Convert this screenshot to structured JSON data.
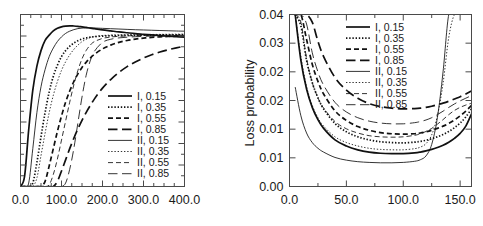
{
  "figure": {
    "panels": [
      {
        "id": "left",
        "xlabel": "",
        "ylabel": "",
        "xticks": [
          "0.0",
          "100.0",
          "200.0",
          "300.0",
          "400.0"
        ],
        "yticks": [],
        "xlim": [
          0,
          400
        ],
        "ylim": [
          0,
          1
        ]
      },
      {
        "id": "right",
        "xlabel": "",
        "ylabel": "Loss probability",
        "xticks": [
          "0.0",
          "50.0",
          "100.0",
          "150.0"
        ],
        "yticks": [
          "0.00",
          "0.01",
          "0.01",
          "0.02",
          "0.02",
          "0.03",
          "0.04"
        ],
        "xlim": [
          0,
          160
        ],
        "ylim": [
          0,
          0.045
        ]
      }
    ],
    "legend": {
      "entries": [
        {
          "label": "I, 0.15",
          "style": "solid",
          "weight": "thick"
        },
        {
          "label": "I, 0.35",
          "style": "dotted",
          "weight": "thick"
        },
        {
          "label": "I, 0.55",
          "style": "dashed",
          "weight": "thick"
        },
        {
          "label": "I, 0.85",
          "style": "long-dashed",
          "weight": "thick"
        },
        {
          "label": "II, 0.15",
          "style": "solid",
          "weight": "thin"
        },
        {
          "label": "II, 0.35",
          "style": "dotted",
          "weight": "thin"
        },
        {
          "label": "II, 0.55",
          "style": "dashed",
          "weight": "thin"
        },
        {
          "label": "II, 0.85",
          "style": "long-dashed",
          "weight": "thin"
        }
      ]
    }
  },
  "chart_data": [
    {
      "type": "line",
      "title": "",
      "xlabel": "",
      "ylabel": "",
      "xlim": [
        0,
        400
      ],
      "ylim": [
        0,
        1
      ],
      "grid": false,
      "legend_position": "lower-right",
      "xticks": [
        0,
        100,
        200,
        300,
        400
      ],
      "xticklabels": [
        "0.0",
        "100.0",
        "200.0",
        "300.0",
        "400.0"
      ],
      "yticklabels": [],
      "note": "Left panel: y-axis tick marks drawn without numeric labels.",
      "x": [
        0,
        10,
        20,
        30,
        40,
        50,
        60,
        70,
        80,
        90,
        100,
        110,
        120,
        130,
        140,
        150,
        160,
        170,
        180,
        200,
        220,
        240,
        260,
        280,
        300,
        320,
        340,
        360,
        380,
        400
      ],
      "series": [
        {
          "name": "I, 0.15",
          "values": [
            0.0,
            0.06,
            0.33,
            0.56,
            0.7,
            0.79,
            0.85,
            0.88,
            0.905,
            0.92,
            0.928,
            0.932,
            0.934,
            0.933,
            0.931,
            0.928,
            0.925,
            0.921,
            0.918,
            0.911,
            0.905,
            0.899,
            0.894,
            0.889,
            0.885,
            0.881,
            0.877,
            0.874,
            0.871,
            0.868
          ]
        },
        {
          "name": "I, 0.35",
          "values": [
            0.0,
            0.0,
            0.0,
            0.02,
            0.14,
            0.29,
            0.43,
            0.55,
            0.64,
            0.705,
            0.755,
            0.79,
            0.815,
            0.834,
            0.848,
            0.858,
            0.864,
            0.868,
            0.871,
            0.8745,
            0.8765,
            0.878,
            0.879,
            0.8795,
            0.88,
            0.8805,
            0.881,
            0.8815,
            0.882,
            0.8825
          ]
        },
        {
          "name": "I, 0.55",
          "values": [
            0.0,
            0.0,
            0.0,
            0.0,
            0.0,
            0.0,
            0.03,
            0.12,
            0.22,
            0.32,
            0.41,
            0.49,
            0.555,
            0.61,
            0.655,
            0.692,
            0.722,
            0.747,
            0.768,
            0.8,
            0.822,
            0.838,
            0.849,
            0.857,
            0.863,
            0.867,
            0.87,
            0.872,
            0.874,
            0.8755
          ]
        },
        {
          "name": "I, 0.85",
          "values": [
            0.0,
            0.0,
            0.0,
            0.0,
            0.0,
            0.0,
            0.0,
            0.0,
            0.0,
            0.03,
            0.09,
            0.155,
            0.22,
            0.28,
            0.335,
            0.385,
            0.43,
            0.47,
            0.508,
            0.572,
            0.622,
            0.663,
            0.697,
            0.724,
            0.747,
            0.766,
            0.782,
            0.795,
            0.806,
            0.816
          ]
        },
        {
          "name": "II, 0.15",
          "values": [
            0.0,
            0.0,
            0.02,
            0.22,
            0.43,
            0.58,
            0.68,
            0.755,
            0.805,
            0.843,
            0.87,
            0.89,
            0.903,
            0.912,
            0.918,
            0.921,
            0.9225,
            0.9225,
            0.9215,
            0.9195,
            0.9175,
            0.9155,
            0.9135,
            0.9115,
            0.91,
            0.9085,
            0.907,
            0.9055,
            0.904,
            0.903
          ]
        },
        {
          "name": "II, 0.35",
          "values": [
            0.0,
            0.0,
            0.0,
            0.0,
            0.05,
            0.18,
            0.31,
            0.43,
            0.53,
            0.61,
            0.675,
            0.725,
            0.765,
            0.797,
            0.822,
            0.842,
            0.856,
            0.866,
            0.872,
            0.878,
            0.88,
            0.8815,
            0.8825,
            0.883,
            0.8835,
            0.884,
            0.8845,
            0.885,
            0.8855,
            0.886
          ]
        },
        {
          "name": "II, 0.55",
          "values": [
            0.0,
            0.0,
            0.0,
            0.0,
            0.0,
            0.0,
            0.0,
            0.01,
            0.07,
            0.16,
            0.27,
            0.38,
            0.49,
            0.59,
            0.675,
            0.742,
            0.79,
            0.822,
            0.842,
            0.861,
            0.869,
            0.873,
            0.8755,
            0.877,
            0.878,
            0.8787,
            0.8793,
            0.8798,
            0.8802,
            0.8806
          ]
        },
        {
          "name": "II, 0.85",
          "values": [
            0.0,
            0.0,
            0.0,
            0.0,
            0.0,
            0.0,
            0.0,
            0.0,
            0.0,
            0.0,
            0.0,
            0.02,
            0.1,
            0.22,
            0.37,
            0.52,
            0.645,
            0.73,
            0.785,
            0.838,
            0.856,
            0.864,
            0.868,
            0.871,
            0.873,
            0.8745,
            0.8755,
            0.8763,
            0.877,
            0.8776
          ]
        }
      ]
    },
    {
      "type": "line",
      "title": "",
      "xlabel": "",
      "ylabel": "Loss probability",
      "xlim": [
        0,
        160
      ],
      "ylim": [
        0,
        0.045
      ],
      "grid": false,
      "legend_position": "upper-right",
      "xticks": [
        0,
        50,
        100,
        150
      ],
      "xticklabels": [
        "0.0",
        "50.0",
        "100.0",
        "150.0"
      ],
      "yticks": [
        0.0,
        0.0075,
        0.015,
        0.0225,
        0.03,
        0.0375,
        0.045
      ],
      "yticklabels": [
        "0.00",
        "0.01",
        "0.01",
        "0.02",
        "0.02",
        "0.03",
        "0.04"
      ],
      "note": "Right panel: tick labels rounded to 2 decimals, producing repeated 0.01 and 0.02 labels.",
      "x": [
        5,
        10,
        15,
        20,
        25,
        30,
        40,
        50,
        60,
        70,
        80,
        90,
        100,
        110,
        115,
        120,
        125,
        130,
        135,
        140,
        145,
        150,
        155,
        160
      ],
      "series": [
        {
          "name": "I, 0.15",
          "values": [
            0.045,
            0.033,
            0.0255,
            0.0207,
            0.0175,
            0.0152,
            0.0122,
            0.0106,
            0.0096,
            0.009,
            0.0087,
            0.0086,
            0.0086,
            0.0088,
            0.009,
            0.0093,
            0.0097,
            0.0102,
            0.0108,
            0.0116,
            0.0126,
            0.0139,
            0.0158,
            0.019
          ]
        },
        {
          "name": "I, 0.35",
          "values": [
            0.045,
            0.042,
            0.033,
            0.0272,
            0.0232,
            0.0203,
            0.0165,
            0.0143,
            0.013,
            0.0122,
            0.0117,
            0.0115,
            0.0114,
            0.0116,
            0.0118,
            0.0121,
            0.0125,
            0.013,
            0.0136,
            0.0144,
            0.0154,
            0.0166,
            0.0182,
            0.0203
          ]
        },
        {
          "name": "I, 0.55",
          "values": [
            0.045,
            0.045,
            0.0385,
            0.032,
            0.0275,
            0.0242,
            0.0198,
            0.0173,
            0.0157,
            0.0147,
            0.0141,
            0.0138,
            0.0137,
            0.0138,
            0.014,
            0.0143,
            0.0147,
            0.0152,
            0.0158,
            0.0165,
            0.0174,
            0.0185,
            0.0197,
            0.0212
          ]
        },
        {
          "name": "I, 0.85",
          "values": [
            0.045,
            0.045,
            0.045,
            0.043,
            0.038,
            0.034,
            0.0285,
            0.0252,
            0.0231,
            0.0217,
            0.0209,
            0.0205,
            0.0203,
            0.0204,
            0.0205,
            0.0207,
            0.021,
            0.0214,
            0.0218,
            0.0223,
            0.0229,
            0.0235,
            0.0242,
            0.025
          ]
        },
        {
          "name": "II, 0.15",
          "values": [
            0.026,
            0.0185,
            0.014,
            0.0115,
            0.01,
            0.009,
            0.0076,
            0.0069,
            0.0065,
            0.0063,
            0.0062,
            0.0062,
            0.0063,
            0.0066,
            0.007,
            0.008,
            0.011,
            0.018,
            0.03,
            0.045,
            0.045,
            0.045,
            0.045,
            0.045
          ]
        },
        {
          "name": "II, 0.35",
          "values": [
            0.045,
            0.034,
            0.0262,
            0.0212,
            0.018,
            0.0158,
            0.013,
            0.0115,
            0.0106,
            0.01,
            0.0097,
            0.0096,
            0.0096,
            0.0099,
            0.0103,
            0.0112,
            0.0135,
            0.0185,
            0.027,
            0.039,
            0.045,
            0.045,
            0.045,
            0.045
          ]
        },
        {
          "name": "II, 0.55",
          "values": [
            0.045,
            0.043,
            0.0335,
            0.0272,
            0.0232,
            0.0205,
            0.017,
            0.0151,
            0.014,
            0.0133,
            0.013,
            0.0129,
            0.013,
            0.0134,
            0.0138,
            0.0144,
            0.0152,
            0.0163,
            0.0175,
            0.0188,
            0.0199,
            0.0207,
            0.0213,
            0.0218
          ]
        },
        {
          "name": "II, 0.85",
          "values": [
            0.045,
            0.045,
            0.0425,
            0.035,
            0.03,
            0.0265,
            0.022,
            0.0195,
            0.018,
            0.0171,
            0.0166,
            0.0164,
            0.0164,
            0.0167,
            0.017,
            0.0174,
            0.018,
            0.0188,
            0.0197,
            0.0207,
            0.0216,
            0.0224,
            0.0231,
            0.0238
          ]
        }
      ]
    }
  ]
}
